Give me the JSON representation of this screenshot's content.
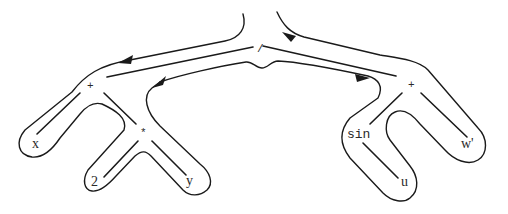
{
  "diagram": {
    "type": "expression-tree-traversal",
    "expression": "(x + 2*y) / (sin(u) + w')",
    "nodes": {
      "root": {
        "label": "/"
      },
      "left_plus": {
        "label": "+"
      },
      "right_plus": {
        "label": "+"
      },
      "times": {
        "label": "*"
      },
      "x": {
        "label": "x"
      },
      "two": {
        "label": "2"
      },
      "y": {
        "label": "y"
      },
      "sin": {
        "label": "sin"
      },
      "u": {
        "label": "u"
      },
      "w_prime": {
        "label": "w'"
      }
    },
    "edges": [
      [
        "/",
        "+ (left)"
      ],
      [
        "/",
        "+ (right)"
      ],
      [
        "+ (left)",
        "x"
      ],
      [
        "+ (left)",
        "*"
      ],
      [
        "*",
        "2"
      ],
      [
        "*",
        "y"
      ],
      [
        "+ (right)",
        "sin"
      ],
      [
        "+ (right)",
        "w'"
      ],
      [
        "sin",
        "u"
      ]
    ],
    "contour": {
      "description": "Euler-tour contour wrapped around the tree, with direction arrows",
      "arrow_count": 4,
      "color": "#1a1a1a"
    }
  }
}
